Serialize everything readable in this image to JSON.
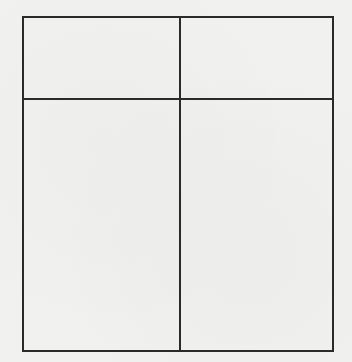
{
  "document": {
    "type": "blank-table",
    "background_color": "#f1f1ef",
    "line_color": "#2a2a2a",
    "table": {
      "rows": 2,
      "columns": 2,
      "cells": [
        [
          "",
          ""
        ],
        [
          "",
          ""
        ]
      ]
    }
  }
}
